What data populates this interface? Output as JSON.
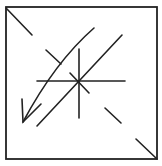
{
  "figure": {
    "stroke_color": "#222222",
    "background": "#ffffff",
    "frame": {
      "x1": 6,
      "y1": 7,
      "x2": 157,
      "y2": 159
    },
    "corner_marks": [
      {
        "name": "top-left-corner-mark",
        "x1": 6,
        "y1": 8,
        "x2": 32,
        "y2": 35
      },
      {
        "name": "bottom-right-corner-mark",
        "x1": 136,
        "y1": 139,
        "x2": 157,
        "y2": 159
      }
    ],
    "cross": {
      "horizontal": {
        "x1": 37,
        "y1": 81,
        "x2": 125,
        "y2": 81
      },
      "vertical": {
        "x1": 79,
        "y1": 49,
        "x2": 79,
        "y2": 118
      },
      "short_diagonal": {
        "x1": 70,
        "y1": 73,
        "x2": 89,
        "y2": 93
      }
    },
    "long_diagonal": {
      "x1": 122,
      "y1": 35,
      "x2": 37,
      "y2": 126
    },
    "upper_tick": {
      "x1": 46,
      "y1": 50,
      "x2": 61,
      "y2": 64
    },
    "lower_tick": {
      "x1": 105,
      "y1": 108,
      "x2": 121,
      "y2": 123
    },
    "arrow": {
      "path": "M94,28 Q55,62 23,122",
      "tip": {
        "x": 23,
        "y": 122
      },
      "barb_left": {
        "x": 22,
        "y": 99
      },
      "barb_right": {
        "x": 41,
        "y": 104
      }
    }
  },
  "caption": {
    "text": ""
  }
}
